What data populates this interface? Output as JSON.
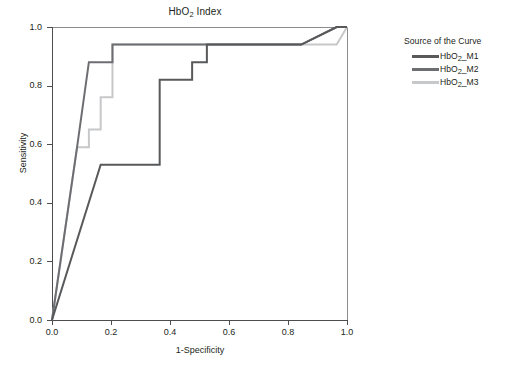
{
  "chart_data": {
    "type": "line",
    "title": "HbO2 Index",
    "title_parts": {
      "prefix": "HbO",
      "sub": "2",
      "suffix": " Index"
    },
    "xlabel": "1-Specificity",
    "ylabel": "Sensitivity",
    "xlim": [
      0.0,
      1.0
    ],
    "ylim": [
      0.0,
      1.0
    ],
    "xticks": [
      "0.0",
      "0.2",
      "0.4",
      "0.6",
      "0.8",
      "1.0"
    ],
    "yticks": [
      "0.0",
      "0.2",
      "0.4",
      "0.6",
      "0.8",
      "1.0"
    ],
    "grid": false,
    "legend_position": "right",
    "legend_title": "Source of the Curve",
    "series": [
      {
        "name": "HbO2_M1",
        "label_prefix": "HbO",
        "label_sub": "2",
        "label_suffix": "_M1",
        "color": "#58595b",
        "points": [
          [
            0.0,
            0.0
          ],
          [
            0.165,
            0.53
          ],
          [
            0.365,
            0.53
          ],
          [
            0.365,
            0.82
          ],
          [
            0.475,
            0.82
          ],
          [
            0.475,
            0.88
          ],
          [
            0.525,
            0.88
          ],
          [
            0.525,
            0.94
          ],
          [
            0.845,
            0.94
          ],
          [
            0.965,
            1.0
          ],
          [
            1.0,
            1.0
          ]
        ]
      },
      {
        "name": "HbO2_M2",
        "label_prefix": "HbO",
        "label_sub": "2",
        "label_suffix": "_M2",
        "color": "#6d6e71",
        "points": [
          [
            0.0,
            0.0
          ],
          [
            0.085,
            0.59
          ],
          [
            0.125,
            0.88
          ],
          [
            0.205,
            0.88
          ],
          [
            0.205,
            0.94
          ],
          [
            0.845,
            0.94
          ],
          [
            0.965,
            1.0
          ],
          [
            1.0,
            1.0
          ]
        ]
      },
      {
        "name": "HbO2_M3",
        "label_prefix": "HbO",
        "label_sub": "2",
        "label_suffix": "_M3",
        "color": "#c7c8ca",
        "points": [
          [
            0.0,
            0.0
          ],
          [
            0.085,
            0.59
          ],
          [
            0.125,
            0.59
          ],
          [
            0.125,
            0.65
          ],
          [
            0.165,
            0.65
          ],
          [
            0.165,
            0.76
          ],
          [
            0.205,
            0.76
          ],
          [
            0.205,
            0.94
          ],
          [
            0.965,
            0.94
          ],
          [
            1.0,
            1.0
          ]
        ]
      }
    ]
  },
  "legend": {
    "title": "Source of the Curve",
    "items": [
      {
        "label_prefix": "HbO",
        "label_sub": "2",
        "label_suffix": "_M1",
        "color": "#58595b"
      },
      {
        "label_prefix": "HbO",
        "label_sub": "2",
        "label_suffix": "_M2",
        "color": "#6d6e71"
      },
      {
        "label_prefix": "HbO",
        "label_sub": "2",
        "label_suffix": "_M3",
        "color": "#c7c8ca"
      }
    ]
  },
  "colors": {
    "axis": "#4d4d4d",
    "frame": "#8c8c8c",
    "text": "#231f20",
    "background": "#ffffff"
  }
}
